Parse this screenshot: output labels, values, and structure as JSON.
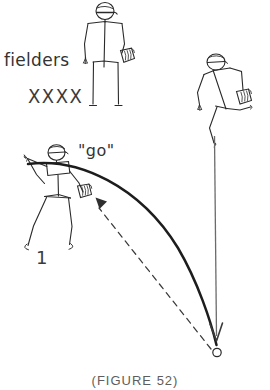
{
  "figure": {
    "caption": "(FIGURE 52)",
    "background_color": "#ffffff",
    "ink_color": "#2a2a2a",
    "secondary_ink_color": "#5d5d5d"
  },
  "annotations": {
    "fielders_label": "fielders",
    "fielder_marks": "XXXX",
    "call_label": "\"go\"",
    "batter_number": "1"
  },
  "icons": {
    "standing_fielder": "standing-fielder-figure-icon",
    "running_fielder": "running-fielder-figure-icon",
    "batter": "batter-figure-icon",
    "glove": "baseball-glove-icon",
    "cap": "baseball-cap-icon",
    "ball": "ball-marker-icon",
    "trajectory": "ball-trajectory-curve-icon",
    "return_throw": "dashed-return-throw-arrow-icon",
    "drop_line": "vertical-drop-line-icon",
    "descent_arrow": "descent-arrow-icon"
  },
  "diagram_elements": [
    {
      "name": "standing-fielder",
      "x": 105,
      "y": 60,
      "description": "fielder standing upright with cap and glove"
    },
    {
      "name": "running-fielder",
      "x": 228,
      "y": 105,
      "description": "fielder running forward with glove extended"
    },
    {
      "name": "batter",
      "x": 50,
      "y": 200,
      "description": "batter with cap swinging, glove at hip"
    },
    {
      "name": "fielder-x-marks",
      "x": 48,
      "y": 97,
      "description": "row of four X marks for additional fielders"
    },
    {
      "name": "ball-trajectory",
      "from": [
        28,
        163
      ],
      "to": [
        217,
        345
      ],
      "description": "thick arcing curve of hit ball"
    },
    {
      "name": "return-throw",
      "from": [
        214,
        353
      ],
      "to": [
        90,
        201
      ],
      "description": "dashed line with arrowhead back to batter glove"
    },
    {
      "name": "ball-landing-marker",
      "x": 217,
      "y": 352,
      "description": "small open circle where ball lands"
    }
  ]
}
